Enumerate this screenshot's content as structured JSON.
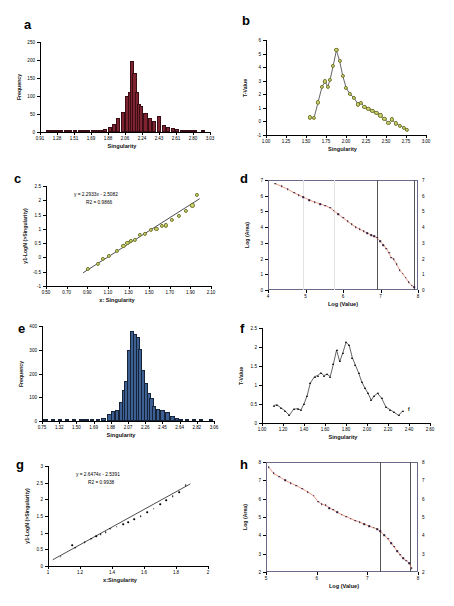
{
  "figure": {
    "panels": [
      "a",
      "b",
      "c",
      "d",
      "e",
      "f",
      "g",
      "h"
    ]
  },
  "labels": {
    "a": "a",
    "b": "b",
    "c": "c",
    "d": "d",
    "e": "e",
    "f": "f",
    "g": "g",
    "h": "h"
  },
  "chart_data": [
    {
      "id": "a",
      "type": "bar",
      "title": "",
      "xlabel": "Singularity",
      "ylabel": "Frequency",
      "xticklabels": [
        "0.91",
        "1.28",
        "1.51",
        "1.69",
        "1.88",
        "2.06",
        "2.24",
        "2.43",
        "2.61",
        "2.80",
        "3.03"
      ],
      "yticklabels": [
        "0",
        "50",
        "100",
        "150",
        "200",
        "250"
      ],
      "ylim": [
        0,
        250
      ],
      "xlim": [
        0.8,
        3.12
      ],
      "grid": false,
      "color": "#7d2430",
      "bin_centers": [
        0.91,
        0.97,
        1.03,
        1.09,
        1.15,
        1.21,
        1.28,
        1.34,
        1.4,
        1.46,
        1.52,
        1.58,
        1.64,
        1.69,
        1.75,
        1.81,
        1.87,
        1.93,
        1.99,
        2.03,
        2.06,
        2.09,
        2.12,
        2.15,
        2.18,
        2.24,
        2.3,
        2.36,
        2.43,
        2.49,
        2.55,
        2.61,
        2.67,
        2.74,
        2.8,
        2.86,
        2.92,
        3.03
      ],
      "values": [
        1,
        1,
        1,
        1,
        1,
        2,
        2,
        2,
        2,
        3,
        3,
        4,
        6,
        9,
        14,
        22,
        38,
        55,
        100,
        112,
        198,
        165,
        112,
        78,
        72,
        54,
        40,
        30,
        44,
        20,
        14,
        11,
        8,
        5,
        4,
        3,
        2,
        1
      ]
    },
    {
      "id": "b",
      "type": "line",
      "title": "",
      "xlabel": "Singularity",
      "ylabel": "T-Value",
      "xticklabels": [
        "1.00",
        "1.25",
        "1.50",
        "1.75",
        "2.00",
        "2.25",
        "2.50",
        "2.75",
        "3.00"
      ],
      "yticklabels": [
        "-1",
        "0",
        "1",
        "2",
        "3",
        "4",
        "5",
        "6"
      ],
      "xlim": [
        1.0,
        3.0
      ],
      "ylim": [
        -1,
        6
      ],
      "grid": false,
      "color": "#c3cb63",
      "x": [
        1.55,
        1.6,
        1.65,
        1.7,
        1.74,
        1.77,
        1.8,
        1.84,
        1.88,
        1.92,
        1.96,
        2.0,
        2.05,
        2.1,
        2.15,
        2.19,
        2.23,
        2.28,
        2.33,
        2.38,
        2.43,
        2.48,
        2.53,
        2.57,
        2.62,
        2.67,
        2.72,
        2.76
      ],
      "y": [
        0.3,
        0.25,
        1.4,
        2.55,
        2.95,
        2.55,
        3.05,
        4.1,
        5.25,
        4.45,
        3.35,
        2.5,
        2.0,
        1.75,
        1.25,
        1.35,
        1.1,
        0.95,
        0.8,
        0.65,
        0.45,
        0.2,
        -0.1,
        0.15,
        -0.15,
        -0.3,
        -0.45,
        -0.6
      ]
    },
    {
      "id": "c",
      "type": "scatter",
      "title": "",
      "xlabel": "x: Singularity",
      "ylabel": "y1-LogN (>Singularity)",
      "equation": "y = 2.2933x - 2.5082",
      "r2": "R2 = 0.9866",
      "xticklabels": [
        "0.50",
        "0.70",
        "0.90",
        "1.10",
        "1.30",
        "1.50",
        "1.70",
        "1.90",
        "2.10"
      ],
      "yticklabels": [
        "-1",
        "-0.5",
        "0",
        "0.5",
        "1",
        "1.5",
        "2",
        "2.5"
      ],
      "xlim": [
        0.5,
        2.1
      ],
      "ylim": [
        -1,
        2.5
      ],
      "grid": false,
      "color": "#cfd46a",
      "slope": 2.2933,
      "intercept": -2.5082,
      "x": [
        0.91,
        1.0,
        1.05,
        1.11,
        1.19,
        1.25,
        1.29,
        1.32,
        1.36,
        1.41,
        1.46,
        1.52,
        1.57,
        1.62,
        1.66,
        1.72,
        1.79,
        1.86,
        1.92,
        1.96
      ],
      "y": [
        -0.4,
        -0.22,
        -0.05,
        0.05,
        0.22,
        0.4,
        0.52,
        0.58,
        0.62,
        0.78,
        0.82,
        0.95,
        1.0,
        1.1,
        1.12,
        1.32,
        1.45,
        1.62,
        1.82,
        2.18
      ]
    },
    {
      "id": "d",
      "type": "line",
      "title": "",
      "xlabel": "Log (Value)",
      "ylabel": "Log (Area)",
      "xticklabels": [
        "4",
        "5",
        "6",
        "7",
        "8"
      ],
      "yticklabels": [
        "0",
        "1",
        "2",
        "3",
        "4",
        "5",
        "6",
        "7"
      ],
      "yticklabels_right": [
        "0",
        "1",
        "2",
        "3",
        "4",
        "5",
        "6",
        "7"
      ],
      "xlim": [
        3.85,
        8.75
      ],
      "ylim": [
        -0.2,
        7.5
      ],
      "grid": true,
      "gridlines_x": [
        5.0,
        6.0
      ],
      "vlines": [
        7.42,
        8.62
      ],
      "color": "#e8846a",
      "x": [
        4.08,
        4.3,
        4.5,
        4.7,
        4.85,
        5.0,
        5.2,
        5.38,
        5.55,
        5.72,
        5.88,
        6.0,
        6.15,
        6.3,
        6.45,
        6.58,
        6.72,
        6.85,
        6.98,
        7.1,
        7.22,
        7.32,
        7.42,
        7.52,
        7.62,
        7.72,
        7.8,
        7.88,
        7.96,
        8.05,
        8.15,
        8.25,
        8.35,
        8.45,
        8.55,
        8.62
      ],
      "y": [
        7.25,
        7.05,
        6.85,
        6.6,
        6.45,
        6.3,
        6.1,
        5.95,
        5.82,
        5.7,
        5.55,
        5.35,
        5.1,
        4.85,
        4.6,
        4.4,
        4.2,
        4.05,
        3.9,
        3.78,
        3.65,
        3.55,
        3.45,
        3.2,
        2.95,
        2.7,
        2.4,
        2.05,
        1.95,
        1.6,
        1.2,
        0.95,
        0.65,
        0.35,
        0.1,
        0.0
      ]
    },
    {
      "id": "e",
      "type": "bar",
      "title": "",
      "xlabel": "Singularity",
      "ylabel": "Frequency",
      "xticklabels": [
        "0.75",
        "1.32",
        "1.50",
        "1.69",
        "1.88",
        "2.07",
        "2.26",
        "2.45",
        "2.64",
        "2.82",
        "3.06"
      ],
      "yticklabels": [
        "0",
        "100",
        "200",
        "300",
        "400"
      ],
      "ylim": [
        0,
        400
      ],
      "xlim": [
        0.7,
        3.1
      ],
      "grid": false,
      "color": "#3d5f92",
      "bin_centers": [
        0.75,
        0.85,
        0.95,
        1.05,
        1.15,
        1.25,
        1.32,
        1.4,
        1.48,
        1.56,
        1.64,
        1.69,
        1.75,
        1.8,
        1.84,
        1.88,
        1.92,
        1.96,
        2.0,
        2.04,
        2.07,
        2.11,
        2.15,
        2.19,
        2.23,
        2.26,
        2.32,
        2.38,
        2.45,
        2.52,
        2.58,
        2.64,
        2.72,
        2.82,
        2.92,
        3.06
      ],
      "values": [
        2,
        2,
        3,
        3,
        4,
        4,
        6,
        8,
        10,
        14,
        28,
        42,
        46,
        78,
        130,
        168,
        300,
        380,
        368,
        352,
        305,
        215,
        160,
        118,
        95,
        62,
        52,
        48,
        38,
        20,
        14,
        10,
        6,
        4,
        3,
        2
      ]
    },
    {
      "id": "f",
      "type": "line",
      "title": "",
      "xlabel": "Singularity",
      "ylabel": "T-Value",
      "xticklabels": [
        "1.00",
        "1.20",
        "1.40",
        "1.60",
        "1.80",
        "2.00",
        "2.20",
        "2.40",
        "2.60"
      ],
      "yticklabels": [
        "0",
        "0.5",
        "1",
        "1.5",
        "2",
        "2.5"
      ],
      "xlim": [
        1.0,
        2.6
      ],
      "ylim": [
        0,
        2.5
      ],
      "grid": false,
      "color": "#000000",
      "annotation": "f",
      "x": [
        1.11,
        1.14,
        1.18,
        1.22,
        1.26,
        1.3,
        1.34,
        1.37,
        1.4,
        1.43,
        1.46,
        1.5,
        1.53,
        1.56,
        1.59,
        1.62,
        1.65,
        1.68,
        1.71,
        1.74,
        1.77,
        1.8,
        1.83,
        1.86,
        1.89,
        1.92,
        1.95,
        1.98,
        2.01,
        2.04,
        2.07,
        2.1,
        2.14,
        2.18,
        2.22,
        2.26,
        2.3,
        2.34
      ],
      "y": [
        0.46,
        0.48,
        0.4,
        0.32,
        0.2,
        0.36,
        0.38,
        0.34,
        0.5,
        0.72,
        1.05,
        1.22,
        1.25,
        1.32,
        1.25,
        1.28,
        1.22,
        1.55,
        1.92,
        1.62,
        1.85,
        2.12,
        2.05,
        1.72,
        1.52,
        1.32,
        1.08,
        0.92,
        0.78,
        0.6,
        0.72,
        0.78,
        0.65,
        0.42,
        0.35,
        0.28,
        0.2,
        0.32
      ]
    },
    {
      "id": "g",
      "type": "scatter",
      "title": "",
      "xlabel": "x:Singularity",
      "ylabel": "y1-LogN (>Singularity)",
      "equation": "y = 2.6474x - 2.5391",
      "r2": "R2 = 0.9938",
      "xticklabels": [
        "1",
        "1.2",
        "1.4",
        "1.6",
        "1.8",
        "2"
      ],
      "yticklabels": [
        "0",
        "0.5",
        "1",
        "1.5",
        "2",
        "2.5",
        "3"
      ],
      "xlim": [
        1.0,
        2.0
      ],
      "ylim": [
        0,
        3
      ],
      "grid": false,
      "color": "#000000",
      "slope": 2.6474,
      "intercept": -2.5391,
      "x": [
        1.08,
        1.15,
        1.17,
        1.23,
        1.27,
        1.3,
        1.33,
        1.36,
        1.39,
        1.43,
        1.47,
        1.5,
        1.54,
        1.58,
        1.62,
        1.66,
        1.7,
        1.74,
        1.78,
        1.82,
        1.86
      ],
      "y": [
        0.28,
        0.62,
        0.55,
        0.72,
        0.82,
        0.9,
        0.95,
        1.02,
        1.12,
        1.18,
        1.25,
        1.32,
        1.4,
        1.5,
        1.62,
        1.72,
        1.85,
        1.98,
        2.1,
        2.22,
        2.42
      ]
    },
    {
      "id": "h",
      "type": "line",
      "title": "",
      "xlabel": "Log (Value)",
      "ylabel": "Log (Area)",
      "xticklabels": [
        "5",
        "6",
        "7",
        "8"
      ],
      "yticklabels": [
        "2",
        "3",
        "4",
        "5",
        "6",
        "7",
        "8"
      ],
      "yticklabels_right": [
        "2",
        "3",
        "4",
        "5",
        "6",
        "7",
        "8"
      ],
      "xlim": [
        4.15,
        8.15
      ],
      "ylim": [
        1.3,
        8.2
      ],
      "grid": true,
      "vlines": [
        7.14,
        7.95
      ],
      "color": "#e8846a",
      "x": [
        4.22,
        4.35,
        4.5,
        4.65,
        4.8,
        4.95,
        5.1,
        5.25,
        5.4,
        5.52,
        5.62,
        5.72,
        5.82,
        5.92,
        6.02,
        6.14,
        6.26,
        6.38,
        6.5,
        6.62,
        6.74,
        6.86,
        6.98,
        7.08,
        7.16,
        7.26,
        7.36,
        7.44,
        7.52,
        7.6,
        7.68,
        7.76,
        7.84,
        7.92,
        7.98
      ],
      "y": [
        7.88,
        7.48,
        7.28,
        7.05,
        6.88,
        6.72,
        6.52,
        6.32,
        6.08,
        5.72,
        5.55,
        5.48,
        5.32,
        5.2,
        5.05,
        4.9,
        4.78,
        4.65,
        4.52,
        4.42,
        4.3,
        4.18,
        4.08,
        4.0,
        3.85,
        3.62,
        3.38,
        3.12,
        2.88,
        2.62,
        2.38,
        2.15,
        2.02,
        1.85,
        1.52
      ]
    }
  ]
}
